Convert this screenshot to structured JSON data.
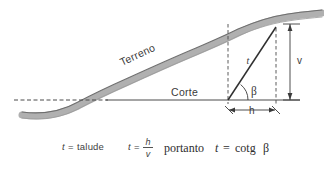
{
  "figure": {
    "title_visible": false,
    "background_color": "#ffffff",
    "terrain_band_color": "#a8a8a8",
    "terrain_edge_color": "#6f6f6f",
    "line_color": "#4a4a4a",
    "text_color": "#3a3a3a",
    "labels": {
      "terrain": "Terreno",
      "cut": "Corte",
      "slope_length": "t",
      "angle": "β",
      "horizontal": "h",
      "vertical": "v"
    },
    "formula": {
      "definition_var": "t",
      "definition_eq": "=",
      "definition_word": "talude",
      "ratio_var": "t",
      "ratio_eq": "=",
      "ratio_numerator": "h",
      "ratio_denominator": "v",
      "conclusion_word": "portanto",
      "conclusion_var": "t",
      "conclusion_eq": "=",
      "conclusion_func": "cotg",
      "conclusion_angle": "β"
    }
  }
}
